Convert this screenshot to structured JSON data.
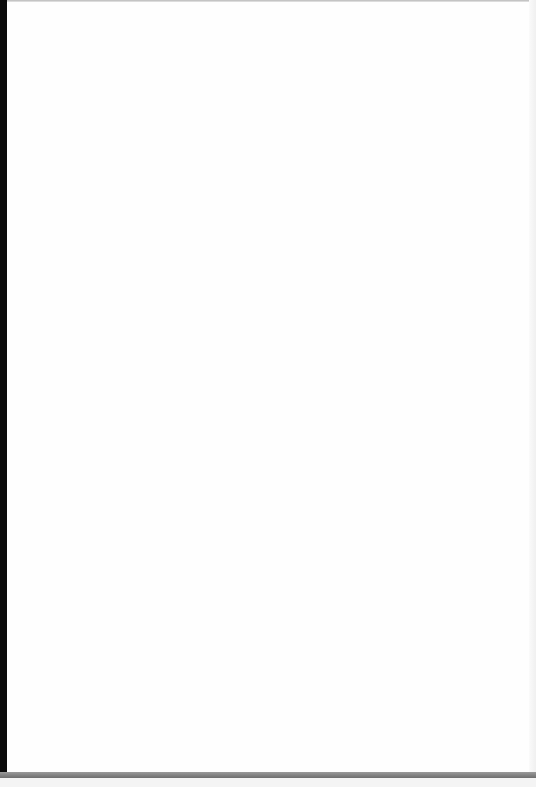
{
  "document": {
    "type": "scanned-page",
    "content_text": "",
    "background_color": "#ffffff",
    "left_edge_color": "#0a0a0a",
    "bottom_bar_color": "#7a7a7a"
  }
}
